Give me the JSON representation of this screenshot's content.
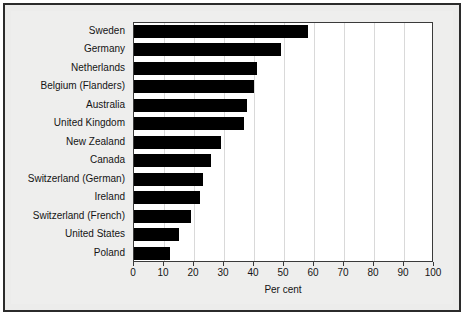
{
  "chart_data": {
    "type": "bar",
    "orientation": "horizontal",
    "title": "",
    "xlabel": "Per cent",
    "ylabel": "",
    "xlim": [
      0,
      100
    ],
    "xticks": [
      0,
      10,
      20,
      30,
      40,
      50,
      60,
      70,
      80,
      90,
      100
    ],
    "grid": true,
    "legend": false,
    "bar_color": "#000000",
    "plot_background": "#ffffff",
    "figure_background": "#ececeb",
    "categories": [
      "Sweden",
      "Germany",
      "Netherlands",
      "Belgium (Flanders)",
      "Australia",
      "United Kingdom",
      "New Zealand",
      "Canada",
      "Switzerland (German)",
      "Ireland",
      "Switzerland (French)",
      "United States",
      "Poland"
    ],
    "values": [
      58,
      49,
      41,
      40,
      37.5,
      36.5,
      29,
      25.5,
      23,
      22,
      19,
      15,
      12
    ]
  }
}
